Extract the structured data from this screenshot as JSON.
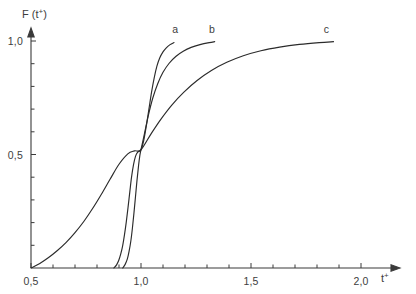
{
  "chart_data": {
    "type": "line",
    "title": "",
    "xlabel": "t+",
    "ylabel": "F (t+)",
    "xlabel_display": "t",
    "xlabel_sup": "+",
    "ylabel_prefix": "F (t",
    "ylabel_sup": "+",
    "ylabel_suffix": ")",
    "xlim": [
      0.5,
      2.05
    ],
    "ylim": [
      0.0,
      1.06
    ],
    "grid": false,
    "legend": "inline-curve-labels",
    "decimal_separator": ",",
    "xticks": [
      0.5,
      1.0,
      1.5,
      2.0
    ],
    "xtick_labels": [
      "0,5",
      "1,0",
      "1,5",
      "2,0"
    ],
    "xminor_step": 0.1,
    "yticks": [
      0.5,
      1.0
    ],
    "ytick_labels": [
      "0,5",
      "1,0"
    ],
    "yminor_step": 0.1,
    "crossing_point": {
      "x": 1.0,
      "y": 0.52
    },
    "series": [
      {
        "name": "a",
        "label": "a",
        "label_x": 1.155,
        "label_y": 1.035,
        "points": [
          [
            0.877,
            0.0
          ],
          [
            0.889,
            0.014
          ],
          [
            0.899,
            0.034
          ],
          [
            0.908,
            0.062
          ],
          [
            0.917,
            0.1
          ],
          [
            0.925,
            0.147
          ],
          [
            0.933,
            0.202
          ],
          [
            0.941,
            0.266
          ],
          [
            0.949,
            0.334
          ],
          [
            0.957,
            0.4
          ],
          [
            0.966,
            0.455
          ],
          [
            0.975,
            0.492
          ],
          [
            0.985,
            0.51
          ],
          [
            1.0,
            0.521
          ],
          [
            1.012,
            0.56
          ],
          [
            1.024,
            0.625
          ],
          [
            1.036,
            0.7
          ],
          [
            1.048,
            0.775
          ],
          [
            1.06,
            0.838
          ],
          [
            1.072,
            0.888
          ],
          [
            1.085,
            0.925
          ],
          [
            1.1,
            0.952
          ],
          [
            1.115,
            0.97
          ],
          [
            1.132,
            0.984
          ],
          [
            1.15,
            0.993
          ]
        ]
      },
      {
        "name": "b",
        "label": "b",
        "label_x": 1.322,
        "label_y": 1.035,
        "points": [
          [
            0.917,
            0.0
          ],
          [
            0.928,
            0.016
          ],
          [
            0.938,
            0.04
          ],
          [
            0.946,
            0.074
          ],
          [
            0.954,
            0.12
          ],
          [
            0.961,
            0.176
          ],
          [
            0.968,
            0.243
          ],
          [
            0.975,
            0.315
          ],
          [
            0.982,
            0.388
          ],
          [
            0.989,
            0.452
          ],
          [
            0.995,
            0.497
          ],
          [
            1.0,
            0.521
          ],
          [
            1.016,
            0.593
          ],
          [
            1.034,
            0.675
          ],
          [
            1.054,
            0.75
          ],
          [
            1.076,
            0.812
          ],
          [
            1.1,
            0.862
          ],
          [
            1.128,
            0.902
          ],
          [
            1.158,
            0.932
          ],
          [
            1.192,
            0.955
          ],
          [
            1.228,
            0.972
          ],
          [
            1.268,
            0.984
          ],
          [
            1.31,
            0.993
          ],
          [
            1.335,
            0.997
          ]
        ]
      },
      {
        "name": "c",
        "label": "c",
        "label_x": 1.843,
        "label_y": 1.035,
        "points": [
          [
            0.5,
            0.0
          ],
          [
            0.54,
            0.02
          ],
          [
            0.58,
            0.046
          ],
          [
            0.62,
            0.077
          ],
          [
            0.66,
            0.113
          ],
          [
            0.7,
            0.156
          ],
          [
            0.74,
            0.205
          ],
          [
            0.78,
            0.262
          ],
          [
            0.82,
            0.325
          ],
          [
            0.86,
            0.392
          ],
          [
            0.9,
            0.457
          ],
          [
            0.94,
            0.503
          ],
          [
            0.97,
            0.516
          ],
          [
            1.0,
            0.521
          ],
          [
            1.045,
            0.59
          ],
          [
            1.09,
            0.655
          ],
          [
            1.14,
            0.718
          ],
          [
            1.195,
            0.775
          ],
          [
            1.255,
            0.826
          ],
          [
            1.32,
            0.87
          ],
          [
            1.39,
            0.906
          ],
          [
            1.465,
            0.935
          ],
          [
            1.545,
            0.957
          ],
          [
            1.63,
            0.973
          ],
          [
            1.72,
            0.985
          ],
          [
            1.81,
            0.993
          ],
          [
            1.875,
            0.997
          ]
        ]
      }
    ]
  }
}
